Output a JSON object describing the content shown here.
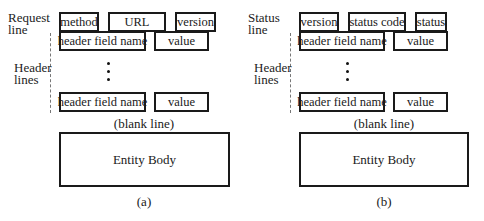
{
  "figure": {
    "panels": [
      {
        "id": "a",
        "first_line_label": [
          "Request",
          "line"
        ],
        "first_line_fields": [
          "method",
          "URL",
          "version"
        ],
        "header_label": [
          "Header",
          "lines"
        ],
        "header_rows": [
          {
            "name": "header field name",
            "value": "value"
          },
          {
            "name": "header field name",
            "value": "value"
          }
        ],
        "blank_line": "(blank line)",
        "entity_body": "Entity Body",
        "caption": "(a)"
      },
      {
        "id": "b",
        "first_line_label": [
          "Status",
          "line"
        ],
        "first_line_fields": [
          "version",
          "status code",
          "status"
        ],
        "header_label": [
          "Header",
          "lines"
        ],
        "header_rows": [
          {
            "name": "header field name",
            "value": "value"
          },
          {
            "name": "header field name",
            "value": "value"
          }
        ],
        "blank_line": "(blank line)",
        "entity_body": "Entity Body",
        "caption": "(b)"
      }
    ]
  }
}
